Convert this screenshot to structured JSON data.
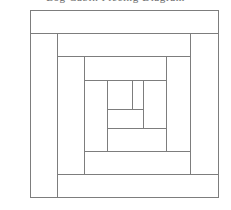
{
  "page": {
    "background_color": "#ffffff",
    "width": 231,
    "height": 210
  },
  "caption": {
    "clipped_text": "Log Cabin Piecing Diagram",
    "note": "only letter descenders visible at top edge"
  },
  "diagram": {
    "type": "line-drawing",
    "line_color": "#7d7d7d",
    "fill_color": "#ffffff",
    "stroke_width": 1,
    "outer_bounds": {
      "x": 30,
      "y": 10,
      "width": 188,
      "height": 187
    },
    "rings": [
      {
        "name": "ring-1",
        "pieces": [
          {
            "name": "top-log",
            "x": 30,
            "y": 10,
            "width": 188,
            "height": 23
          },
          {
            "name": "left-log",
            "x": 30,
            "y": 33,
            "width": 27,
            "height": 164
          },
          {
            "name": "bottom-log",
            "x": 57,
            "y": 174,
            "width": 161,
            "height": 23
          },
          {
            "name": "right-log",
            "x": 190,
            "y": 33,
            "width": 28,
            "height": 141
          }
        ]
      },
      {
        "name": "ring-2",
        "pieces": [
          {
            "name": "top-log",
            "x": 57,
            "y": 33,
            "width": 133,
            "height": 23
          },
          {
            "name": "left-log",
            "x": 57,
            "y": 56,
            "width": 27,
            "height": 118
          },
          {
            "name": "bottom-log",
            "x": 84,
            "y": 151,
            "width": 106,
            "height": 23
          },
          {
            "name": "right-log",
            "x": 166,
            "y": 56,
            "width": 24,
            "height": 95
          }
        ]
      },
      {
        "name": "ring-3",
        "pieces": [
          {
            "name": "top-log",
            "x": 84,
            "y": 56,
            "width": 82,
            "height": 24
          },
          {
            "name": "left-log",
            "x": 84,
            "y": 80,
            "width": 23,
            "height": 71
          },
          {
            "name": "bottom-log",
            "x": 107,
            "y": 128,
            "width": 59,
            "height": 23
          },
          {
            "name": "right-log",
            "x": 143,
            "y": 80,
            "width": 23,
            "height": 48
          }
        ]
      },
      {
        "name": "center",
        "pieces": [
          {
            "name": "center-square-left",
            "x": 107,
            "y": 80,
            "width": 25,
            "height": 29
          },
          {
            "name": "center-square-right",
            "x": 132,
            "y": 80,
            "width": 11,
            "height": 29
          },
          {
            "name": "center-bottom-log",
            "x": 107,
            "y": 109,
            "width": 36,
            "height": 19
          }
        ]
      }
    ]
  }
}
